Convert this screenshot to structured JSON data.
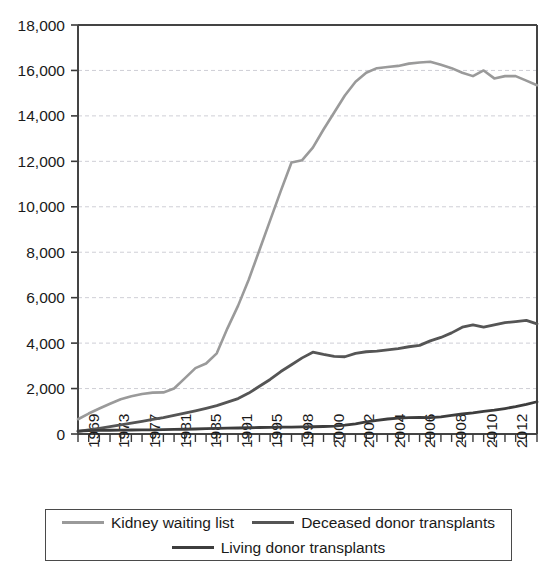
{
  "chart_data": {
    "type": "line",
    "title": "",
    "subtitle": "",
    "xlabel": "",
    "ylabel": "",
    "xlim": [
      1969,
      2012
    ],
    "ylim": [
      0,
      18000
    ],
    "y_ticks": [
      0,
      2000,
      4000,
      6000,
      8000,
      10000,
      12000,
      14000,
      16000,
      18000
    ],
    "y_tick_labels": [
      "0",
      "2,000",
      "4,000",
      "6,000",
      "8,000",
      "10,000",
      "12,000",
      "14,000",
      "16,000",
      "18,000"
    ],
    "x_tick_labels": [
      "1969",
      "1973",
      "1977",
      "1981",
      "1985",
      "1991",
      "1995",
      "1998",
      "2000",
      "2002",
      "2004",
      "2006",
      "2008",
      "2010",
      "2012"
    ],
    "x": [
      1969,
      1970,
      1971,
      1972,
      1973,
      1974,
      1975,
      1976,
      1977,
      1978,
      1979,
      1980,
      1981,
      1982,
      1983,
      1984,
      1985,
      1986,
      1987,
      1988,
      1989,
      1990,
      1991,
      1992,
      1993,
      1994,
      1995,
      1996,
      1997,
      1998,
      1999,
      2000,
      2001,
      2002,
      2003,
      2004,
      2005,
      2006,
      2007,
      2008,
      2009,
      2010,
      2011,
      2012
    ],
    "grid": "horizontal-dashed",
    "legend_position": "bottom",
    "series": [
      {
        "name": "Kidney waiting list",
        "color": "#9a9a9a",
        "stroke_width": 2.6,
        "values": [
          650,
          900,
          1120,
          1330,
          1530,
          1660,
          1760,
          1820,
          1830,
          2000,
          2450,
          2900,
          3100,
          3550,
          4650,
          5650,
          6800,
          8100,
          9400,
          10700,
          11950,
          12050,
          12600,
          13400,
          14150,
          14900,
          15500,
          15900,
          16100,
          16150,
          16200,
          16300,
          16350,
          16380,
          16250,
          16100,
          15900,
          15750,
          16000,
          15650,
          15750,
          15750,
          15550,
          15350
        ]
      },
      {
        "name": "Deceased donor transplants",
        "color": "#555555",
        "stroke_width": 2.8,
        "values": [
          120,
          180,
          250,
          320,
          400,
          480,
          560,
          640,
          720,
          820,
          920,
          1020,
          1130,
          1250,
          1400,
          1560,
          1800,
          2100,
          2400,
          2750,
          3050,
          3350,
          3600,
          3500,
          3420,
          3400,
          3550,
          3620,
          3650,
          3700,
          3760,
          3840,
          3900,
          4100,
          4250,
          4450,
          4700,
          4800,
          4700,
          4800,
          4900,
          4950,
          5000,
          4850
        ]
      },
      {
        "name": "Living donor transplants",
        "color": "#3d3d3d",
        "stroke_width": 2.8,
        "values": [
          130,
          150,
          160,
          165,
          170,
          175,
          180,
          185,
          190,
          200,
          210,
          220,
          235,
          245,
          255,
          265,
          275,
          285,
          295,
          300,
          305,
          310,
          320,
          330,
          350,
          390,
          450,
          530,
          600,
          660,
          700,
          720,
          730,
          720,
          750,
          820,
          880,
          930,
          1000,
          1050,
          1120,
          1200,
          1300,
          1420
        ]
      }
    ]
  },
  "legend": {
    "rows": [
      [
        {
          "label": "Kidney waiting list",
          "color": "#9a9a9a"
        },
        {
          "label": "Deceased donor transplants",
          "color": "#555555"
        }
      ],
      [
        {
          "label": "Living donor transplants",
          "color": "#3d3d3d"
        }
      ]
    ]
  }
}
